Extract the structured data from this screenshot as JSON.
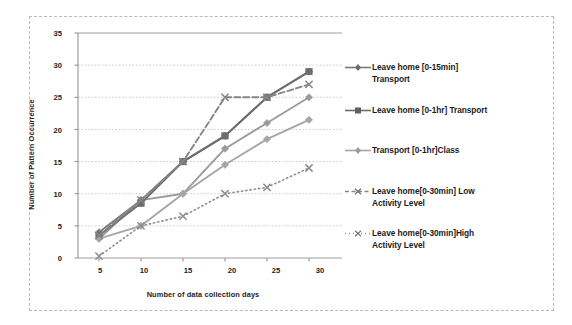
{
  "chart_data": {
    "type": "line",
    "title": "",
    "xlabel": "Number of data collection days",
    "ylabel": "Number of Pattern Occurrence",
    "x": [
      5,
      10,
      15,
      20,
      25,
      30
    ],
    "xticks": [
      "5",
      "10",
      "15",
      "20",
      "25",
      "30"
    ],
    "yticks": [
      "0",
      "5",
      "10",
      "15",
      "20",
      "25",
      "30",
      "35"
    ],
    "xlim": [
      2.5,
      32.5
    ],
    "ylim": [
      0,
      35
    ],
    "grid": true,
    "legend_position": "right",
    "series": [
      {
        "name": "Leave home [0-15min] Transport",
        "label": "Leave home [0-15min]\nTransport",
        "values": [
          4,
          9,
          15,
          19,
          25,
          29
        ],
        "color": "#7a7a7a",
        "style": "solid",
        "marker": "diamond"
      },
      {
        "name": "Leave home [0-1hr] Transport",
        "label": "Leave home [0-1hr] Transport",
        "values": [
          3.5,
          8.5,
          15,
          19,
          25,
          29
        ],
        "color": "#6d6d6d",
        "style": "solid",
        "marker": "square"
      },
      {
        "name": "Transport [0-1hr]Class",
        "label": "Transport [0-1hr]Class",
        "values": [
          3,
          5,
          10,
          14.5,
          18.5,
          21.5
        ],
        "color": "#a6a6a6",
        "style": "solid",
        "marker": "diamond"
      },
      {
        "name": "Leave home[0-30min] Low Activity Level",
        "label": "Leave home[0-30min] Low\nActivity Level",
        "values": [
          3.5,
          9,
          15,
          25,
          25,
          27
        ],
        "color": "#858585",
        "style": "dashed",
        "marker": "cross"
      },
      {
        "name": "Leave home[0-30min]High Activity Level",
        "label": "Leave home[0-30min]High\nActivity Level",
        "values": [
          0.3,
          5,
          6.5,
          10,
          11,
          14
        ],
        "color": "#8f8f8f",
        "style": "dotted",
        "marker": "cross"
      }
    ],
    "extra_series_points": [
      {
        "name": "Transport [0-1hr]Class secondary",
        "values": [
          3,
          9,
          10,
          17,
          21,
          25
        ],
        "color": "#9a9a9a",
        "style": "solid",
        "marker": "diamond"
      }
    ]
  }
}
